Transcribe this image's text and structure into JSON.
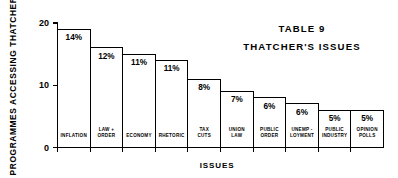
{
  "figure": {
    "title_line1": "TABLE 9",
    "title_line2": "THATCHER'S ISSUES"
  },
  "chart_data": {
    "type": "bar",
    "xlabel": "ISSUES",
    "ylabel": "PROGRAMMES ACCESSING THATCHER",
    "ylim": [
      0,
      20
    ],
    "yticks": [
      "0",
      "10",
      "20"
    ],
    "ytick_values": [
      0,
      10,
      20
    ],
    "grid": false,
    "legend": null,
    "categories": [
      "INFLATION",
      "LAW + ORDER",
      "ECONOMY",
      "RHETORIC",
      "TAX CUTS",
      "UNION LAW",
      "PUBLIC ORDER",
      "UNEMP - LOYMENT",
      "PUBLIC INDUSTRY",
      "OPINION POLLS"
    ],
    "category_lines": [
      [
        "INFLATION"
      ],
      [
        "LAW +",
        "ORDER"
      ],
      [
        "ECONOMY"
      ],
      [
        "RHETORIC"
      ],
      [
        "TAX",
        "CUTS"
      ],
      [
        "UNION",
        "LAW"
      ],
      [
        "PUBLIC",
        "ORDER"
      ],
      [
        "UNEMP -",
        "LOYMENT"
      ],
      [
        "PUBLIC",
        "INDUSTRY"
      ],
      [
        "OPINION",
        "POLLS"
      ]
    ],
    "values": [
      19,
      16,
      15,
      14,
      11,
      9,
      8,
      7,
      6,
      6
    ],
    "data_labels": [
      "14%",
      "12%",
      "11%",
      "11%",
      "8%",
      "7%",
      "6%",
      "6%",
      "5%",
      "5%"
    ]
  },
  "colors": {
    "ink": "#000000",
    "paper": "#ffffff"
  }
}
